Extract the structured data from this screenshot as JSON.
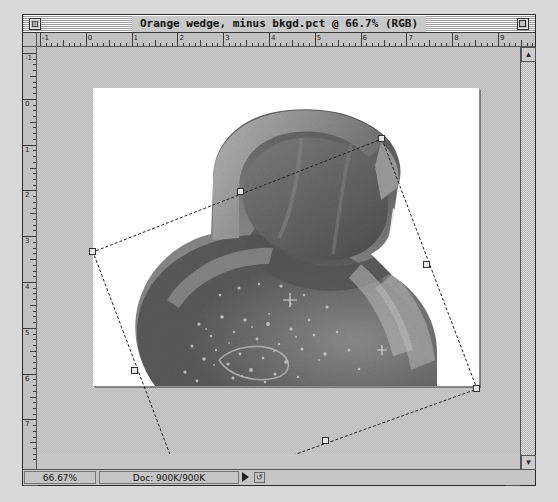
{
  "window": {
    "title": "Orange wedge, minus bkgd.pct @ 66.7% (RGB)",
    "close_icon": "close-box-icon",
    "zoom_icon": "zoom-box-icon"
  },
  "rulers": {
    "unit": "inches",
    "horizontal_labels": [
      "-1",
      "0",
      "1",
      "2",
      "3",
      "4",
      "5",
      "6",
      "7",
      "8",
      "9"
    ],
    "vertical_labels": [
      "-1",
      "0",
      "1",
      "2",
      "3",
      "4",
      "5",
      "6",
      "7"
    ]
  },
  "document": {
    "image_name": "Orange wedge, minus bkgd.pct",
    "color_mode": "RGB",
    "zoom_level": "66.7%"
  },
  "transform": {
    "tool": "free-transform",
    "handles": [
      {
        "name": "handle-top-corner",
        "x": 289,
        "y": 51
      },
      {
        "name": "handle-top-mid",
        "x": 148,
        "y": 104
      },
      {
        "name": "handle-left-corner",
        "x": 0,
        "y": 164
      },
      {
        "name": "handle-left-mid",
        "x": 42,
        "y": 283
      },
      {
        "name": "handle-bottom-corner",
        "x": 92,
        "y": 406
      },
      {
        "name": "handle-bottom-mid",
        "x": 233,
        "y": 353
      },
      {
        "name": "handle-right-corner",
        "x": 384,
        "y": 301
      },
      {
        "name": "handle-right-mid",
        "x": 334,
        "y": 177
      }
    ]
  },
  "statusbar": {
    "zoom_value": "66.67%",
    "doc_label": "Doc: 900K/900K",
    "popup_icon": "popup-triangle-icon",
    "tool_icon": "pointer-tool-icon"
  },
  "scrollbars": {
    "v_up_icon": "▲",
    "v_down_icon": "▼",
    "h_left_icon": "◀",
    "h_right_icon": "▶",
    "grow_icon": "grow-box-icon"
  },
  "colors": {
    "window_chrome": "#c6c6c6",
    "canvas": "#ffffff",
    "pasteboard": "#c3c3c3",
    "frame": "#2b2b2b"
  }
}
